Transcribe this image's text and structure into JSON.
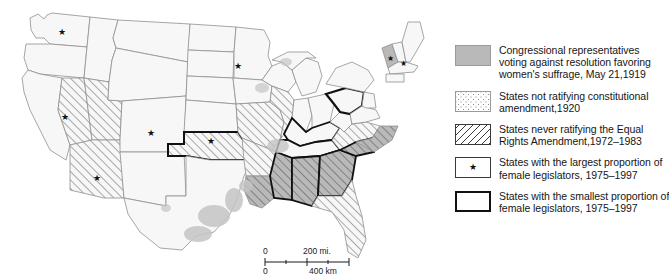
{
  "legend": {
    "items": [
      {
        "swatch": "solid-gray",
        "lines": [
          "Congressional representatives",
          "voting against resolution favoring",
          "women's suffrage, May 21,1919"
        ]
      },
      {
        "swatch": "dotted",
        "lines": [
          "States not ratifying constitutional",
          "amendment,1920"
        ]
      },
      {
        "swatch": "diagonal-hatch",
        "lines": [
          "States never ratifying the Equal",
          "Rights Amendment,1972–1983"
        ]
      },
      {
        "swatch": "star-box",
        "star_glyph": "★",
        "lines": [
          "States with the largest proportion of",
          "female legislators, 1975–1997"
        ]
      },
      {
        "swatch": "thick-outline-box",
        "lines": [
          "States with the smallest proportion of",
          "female legislators, 1975–1997"
        ]
      }
    ]
  },
  "scalebar": {
    "miles_zero": "0",
    "miles_max": "200 mi.",
    "km_zero": "0",
    "km_max": "400 km"
  },
  "map": {
    "colors": {
      "land": "#f7f7f7",
      "state_border": "#8f8f8f",
      "highlight_border": "#111111",
      "gray_fill": "#b9b9b9",
      "district_gray": "#c4c4c4",
      "hatch_line": "#555555"
    },
    "star_glyph": "★",
    "states_with_stars": [
      {
        "name": "Washington",
        "x": 62,
        "y": 32
      },
      {
        "name": "Minnesota",
        "x": 238,
        "y": 66
      },
      {
        "name": "Nevada",
        "x": 65,
        "y": 117
      },
      {
        "name": "Colorado",
        "x": 151,
        "y": 133
      },
      {
        "name": "Kansas",
        "x": 211,
        "y": 141
      },
      {
        "name": "Arizona",
        "x": 97,
        "y": 178
      },
      {
        "name": "Vermont",
        "x": 394,
        "y": 58
      },
      {
        "name": "New Hampshire",
        "x": 404,
        "y": 64
      }
    ],
    "hatched_states": [
      "Nevada",
      "Utah",
      "Arizona",
      "Missouri",
      "Illinois",
      "Oklahoma",
      "Arkansas",
      "Louisiana",
      "Mississippi",
      "Alabama",
      "Georgia",
      "Florida",
      "South Carolina",
      "North Carolina",
      "Virginia"
    ],
    "gray_filled_states": [
      "Mississippi",
      "Alabama",
      "Georgia",
      "South Carolina",
      "North Carolina",
      "Virginia",
      "Louisiana"
    ],
    "bold_outlined_states": [
      "Pennsylvania",
      "Kentucky",
      "Tennessee",
      "Oklahoma",
      "Mississippi",
      "Alabama",
      "Georgia",
      "South Carolina"
    ]
  }
}
